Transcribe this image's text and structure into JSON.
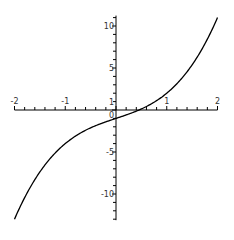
{
  "chart_data": {
    "type": "line",
    "title": "",
    "xlabel": "",
    "ylabel": "",
    "function": "y = x^3 + 2x - 1",
    "xlim": [
      -2,
      2
    ],
    "ylim": [
      -13,
      11
    ],
    "grid": false,
    "legend": null,
    "x_ticks": [
      {
        "value": -2,
        "label": "-2"
      },
      {
        "value": -1,
        "label": "-1"
      },
      {
        "value": 0,
        "label": "0"
      },
      {
        "value": 1,
        "label": "1"
      },
      {
        "value": 2,
        "label": "2"
      }
    ],
    "y_ticks": [
      {
        "value": 10,
        "label": "10"
      },
      {
        "value": 5,
        "label": "5"
      },
      {
        "value": 1,
        "label": "1"
      },
      {
        "value": 0,
        "label": "0"
      },
      {
        "value": -5,
        "label": "-5"
      },
      {
        "value": -10,
        "label": "-10"
      }
    ],
    "series": [
      {
        "name": "curve",
        "color": "#000000",
        "x": [
          -2,
          -1.75,
          -1.5,
          -1.25,
          -1,
          -0.75,
          -0.5,
          -0.25,
          0,
          0.25,
          0.5,
          0.75,
          1,
          1.25,
          1.5,
          1.75,
          2
        ],
        "values": [
          -13,
          -10.86,
          -7.38,
          -5.45,
          -4,
          -2.92,
          -2.13,
          -1.52,
          -1,
          -0.48,
          0.13,
          0.92,
          2,
          3.45,
          5.38,
          7.86,
          11
        ]
      }
    ]
  },
  "layout": {
    "x_axis_y_px": 110,
    "y_axis_x_px": 116,
    "x_px_per_unit": 50.75,
    "y_px_per_unit": 8.4
  }
}
